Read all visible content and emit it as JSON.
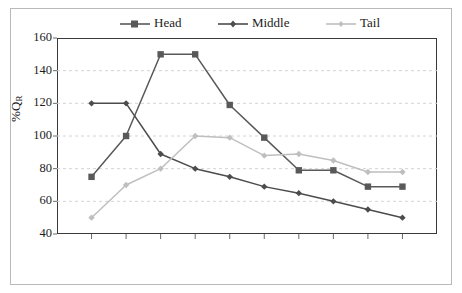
{
  "chart_data": {
    "type": "line",
    "title": "",
    "xlabel": "",
    "ylabel": "%QR",
    "ylim": [
      40,
      160
    ],
    "ytick_values": [
      160,
      140,
      120,
      100,
      80,
      60,
      40
    ],
    "ytick_labels": [
      "160",
      "140",
      "120",
      "100",
      "80",
      "60",
      "40"
    ],
    "xtick_labels": [],
    "x": [
      1,
      2,
      3,
      4,
      5,
      6,
      7,
      8,
      9,
      10
    ],
    "grid": "horizontal-dashed",
    "legend_position": "top",
    "series": [
      {
        "name": "Head",
        "color": "#595959",
        "marker": "square",
        "values": [
          75,
          100,
          150,
          150,
          119,
          99,
          79,
          79,
          69,
          69
        ]
      },
      {
        "name": "Middle",
        "color": "#4c4c4c",
        "marker": "diamond",
        "values": [
          120,
          120,
          89,
          80,
          75,
          69,
          65,
          60,
          55,
          50
        ]
      },
      {
        "name": "Tail",
        "color": "#bfbfbf",
        "marker": "diamond",
        "values": [
          50,
          70,
          80,
          100,
          99,
          88,
          89,
          85,
          78,
          78
        ]
      }
    ]
  },
  "legend": {
    "items": [
      {
        "label": "Head"
      },
      {
        "label": "Middle"
      },
      {
        "label": "Tail"
      }
    ]
  },
  "axis": {
    "y_title_main": "%Q",
    "y_title_sub": "R"
  },
  "colors": {
    "frame": "#3a3a3a",
    "outer_frame": "#b9b9b9",
    "gridline": "#d4d4d4",
    "background": "#ffffff",
    "head": "#595959",
    "middle": "#4c4c4c",
    "tail": "#bfbfbf"
  }
}
